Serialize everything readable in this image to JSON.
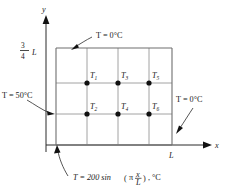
{
  "figure": {
    "axes": {
      "x_label": "x",
      "y_label": "y",
      "x_tick_label": "L",
      "y_tick_numerator": "3",
      "y_tick_denominator": "4",
      "y_tick_unit": "L"
    },
    "boundaries": {
      "top": "T = 0°C",
      "left": "T = 50°C",
      "right": "T = 0°C",
      "bottom_prefix": "T = 200 sin",
      "bottom_open_paren": "(",
      "bottom_pi": "π",
      "bottom_frac_num": "x",
      "bottom_frac_den": "L",
      "bottom_close_paren": ")",
      "bottom_suffix": ", °C"
    },
    "nodes": [
      {
        "id": "T1",
        "base": "T",
        "sub": "1",
        "cx": 87,
        "cy": 83
      },
      {
        "id": "T3",
        "base": "T",
        "sub": "3",
        "cx": 118,
        "cy": 83
      },
      {
        "id": "T5",
        "base": "T",
        "sub": "5",
        "cx": 149,
        "cy": 83
      },
      {
        "id": "T2",
        "base": "T",
        "sub": "2",
        "cx": 87,
        "cy": 114
      },
      {
        "id": "T4",
        "base": "T",
        "sub": "4",
        "cx": 118,
        "cy": 114
      },
      {
        "id": "T6",
        "base": "T",
        "sub": "6",
        "cx": 149,
        "cy": 114
      }
    ],
    "colors": {
      "grid": "#8a8a8a",
      "border": "#6e6e6e",
      "axis": "#2b2b2b",
      "node": "#111111",
      "text": "#1a1a1a",
      "background": "#ffffff"
    },
    "geometry": {
      "grid_left": 56,
      "grid_right": 172,
      "grid_top": 48,
      "grid_bottom": 145,
      "columns": 4,
      "rows": 4
    }
  }
}
